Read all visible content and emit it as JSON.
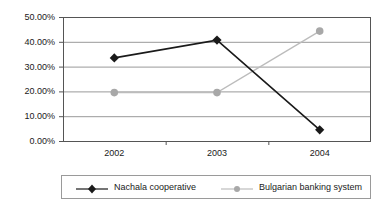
{
  "chart_data": {
    "type": "line",
    "title": "",
    "xlabel": "",
    "ylabel": "",
    "categories": [
      "2002",
      "2003",
      "2004"
    ],
    "ylim": [
      0,
      50
    ],
    "ytick_values": [
      0,
      10,
      20,
      30,
      40,
      50
    ],
    "ytick_labels": [
      "0.00%",
      "10.00%",
      "20.00%",
      "30.00%",
      "40.00%",
      "50.00%"
    ],
    "grid": true,
    "legend_position": "bottom",
    "series": [
      {
        "name": "Nachala cooperative",
        "values": [
          33.5,
          40.7,
          4.5
        ],
        "color": "#1a1a1a",
        "marker": "diamond"
      },
      {
        "name": "Bulgarian banking system",
        "values": [
          19.5,
          19.5,
          44.3
        ],
        "color": "#a8a8a8",
        "marker": "circle"
      }
    ]
  },
  "legend": {
    "entries": [
      {
        "label": "Nachala cooperative"
      },
      {
        "label": "Bulgarian banking system"
      }
    ]
  },
  "colors": {
    "series1": "#1a1a1a",
    "series2": "#a8a8a8",
    "grid": "#999999",
    "axis": "#555555",
    "background": "#ffffff"
  }
}
